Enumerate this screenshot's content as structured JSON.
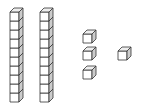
{
  "figure": {
    "colors": {
      "stroke": "#333333",
      "face": "#ffffff",
      "side": "#cccccc",
      "top": "#eeeeee"
    },
    "tens_rods": [
      {
        "x": 10,
        "y": 8,
        "cubes": 10
      },
      {
        "x": 40,
        "y": 8,
        "cubes": 10
      }
    ],
    "unit_cubes": [
      {
        "x": 83,
        "y": 30
      },
      {
        "x": 83,
        "y": 47
      },
      {
        "x": 83,
        "y": 66
      },
      {
        "x": 118,
        "y": 47
      }
    ],
    "counts": {
      "tens": 2,
      "ones": 4
    }
  }
}
